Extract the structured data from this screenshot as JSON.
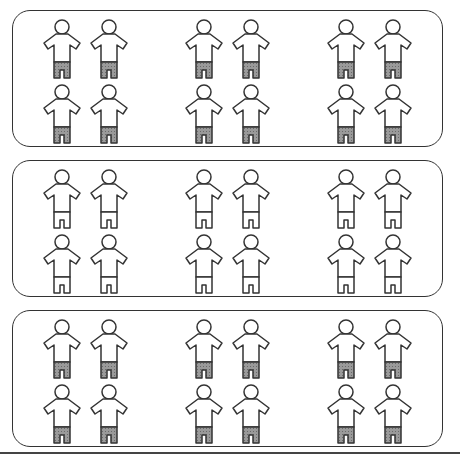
{
  "diagram": {
    "colors": {
      "outline": "#333333",
      "shaded_shorts": "#8a8a8a",
      "plain_shorts": "#ffffff",
      "background": "#ffffff"
    },
    "boxes": [
      {
        "id": "box-1",
        "shorts": "shaded",
        "groups": 3,
        "figures_per_group": 4
      },
      {
        "id": "box-2",
        "shorts": "plain",
        "groups": 3,
        "figures_per_group": 4
      },
      {
        "id": "box-3",
        "shorts": "shaded",
        "groups": 3,
        "figures_per_group": 4
      }
    ]
  }
}
